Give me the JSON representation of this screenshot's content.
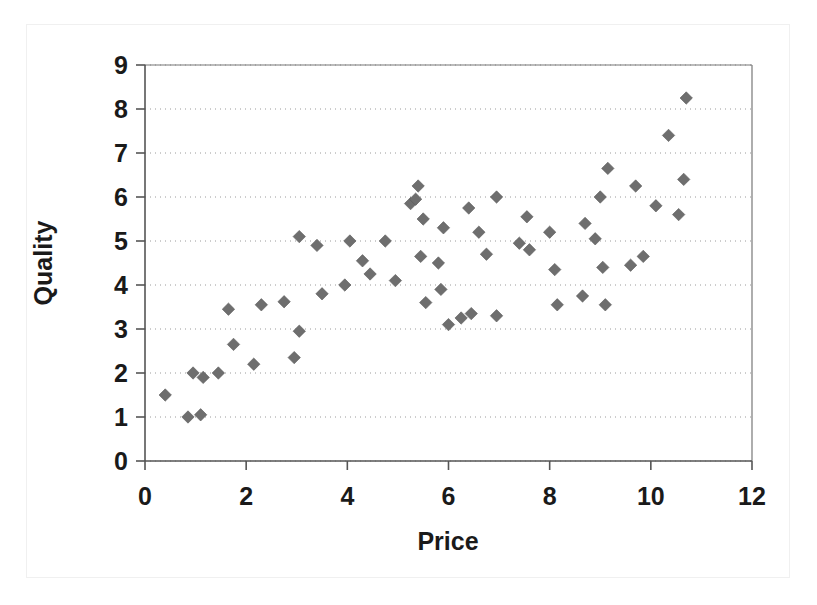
{
  "chart_data": {
    "type": "scatter",
    "title": "",
    "xlabel": "Price",
    "ylabel": "Quality",
    "xlim": [
      0,
      12
    ],
    "ylim": [
      0,
      9
    ],
    "xticks": [
      0,
      2,
      4,
      6,
      8,
      10,
      12
    ],
    "yticks": [
      0,
      1,
      2,
      3,
      4,
      5,
      6,
      7,
      8,
      9
    ],
    "xtick_labels": [
      "0",
      "2",
      "4",
      "6",
      "8",
      "10",
      "12"
    ],
    "ytick_labels": [
      "0",
      "1",
      "2",
      "3",
      "4",
      "5",
      "6",
      "7",
      "8",
      "9"
    ],
    "grid": "horizontal-dotted",
    "legend": "none",
    "marker": "diamond",
    "marker_color": "#6e6e6e",
    "series": [
      {
        "name": "Observations",
        "points": [
          [
            0.4,
            1.5
          ],
          [
            0.85,
            1.0
          ],
          [
            0.95,
            2.0
          ],
          [
            1.1,
            1.05
          ],
          [
            1.15,
            1.9
          ],
          [
            1.45,
            2.0
          ],
          [
            1.65,
            3.45
          ],
          [
            1.75,
            2.65
          ],
          [
            2.15,
            2.2
          ],
          [
            2.3,
            3.55
          ],
          [
            2.75,
            3.62
          ],
          [
            2.95,
            2.35
          ],
          [
            3.05,
            2.95
          ],
          [
            3.05,
            5.1
          ],
          [
            3.4,
            4.9
          ],
          [
            3.5,
            3.8
          ],
          [
            3.95,
            4.0
          ],
          [
            4.05,
            5.0
          ],
          [
            4.3,
            4.55
          ],
          [
            4.45,
            4.25
          ],
          [
            4.75,
            5.0
          ],
          [
            4.95,
            4.1
          ],
          [
            5.25,
            5.85
          ],
          [
            5.35,
            5.95
          ],
          [
            5.4,
            6.25
          ],
          [
            5.45,
            4.65
          ],
          [
            5.5,
            5.5
          ],
          [
            5.55,
            3.6
          ],
          [
            5.8,
            4.5
          ],
          [
            5.85,
            3.9
          ],
          [
            5.9,
            5.3
          ],
          [
            6.0,
            3.1
          ],
          [
            6.25,
            3.25
          ],
          [
            6.4,
            5.75
          ],
          [
            6.45,
            3.35
          ],
          [
            6.6,
            5.2
          ],
          [
            6.75,
            4.7
          ],
          [
            6.95,
            3.3
          ],
          [
            6.95,
            6.0
          ],
          [
            7.4,
            4.95
          ],
          [
            7.55,
            5.55
          ],
          [
            7.6,
            4.8
          ],
          [
            8.0,
            5.2
          ],
          [
            8.1,
            4.35
          ],
          [
            8.15,
            3.55
          ],
          [
            8.65,
            3.75
          ],
          [
            8.7,
            5.4
          ],
          [
            8.9,
            5.05
          ],
          [
            9.0,
            6.0
          ],
          [
            9.05,
            4.4
          ],
          [
            9.1,
            3.55
          ],
          [
            9.15,
            6.65
          ],
          [
            9.6,
            4.45
          ],
          [
            9.7,
            6.25
          ],
          [
            9.85,
            4.65
          ],
          [
            10.1,
            5.8
          ],
          [
            10.35,
            7.4
          ],
          [
            10.55,
            5.6
          ],
          [
            10.65,
            6.4
          ],
          [
            10.7,
            8.25
          ]
        ]
      }
    ]
  },
  "figure": {
    "background_color": "#ffffff",
    "frame_color": "#f0f0f0",
    "axis_color": "#555555",
    "grid_color": "#9a9a9a"
  }
}
